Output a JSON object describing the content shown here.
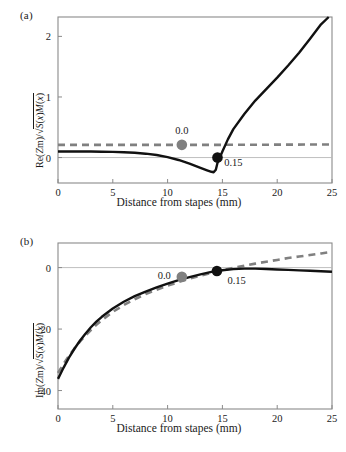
{
  "figure": {
    "panels": [
      {
        "id": "a",
        "label": "(a)",
        "xlabel": "Distance from stapes (mm)",
        "ylabel_parts": {
          "numerator": "Re(Zm)",
          "slash": "/",
          "radical": "√",
          "under_radical": "S(x)M(x)"
        },
        "annotations": [
          {
            "text": "0.0",
            "x_mm": 11.3,
            "y_val": 0.42
          },
          {
            "text": "0.15",
            "x_mm": 16.0,
            "y_val": -0.11
          }
        ],
        "markers": [
          {
            "label": "0.0",
            "color": "#808080",
            "x_mm": 11.3,
            "y_val": 0.21
          },
          {
            "label": "0.15",
            "color": "#111111",
            "x_mm": 14.55,
            "y_val": 0.0
          }
        ],
        "xticks": [
          0,
          5,
          10,
          15,
          20,
          25
        ],
        "yticks": [
          0,
          1,
          2
        ],
        "xlim": [
          0,
          25
        ],
        "ylim": [
          -0.42,
          2.32
        ]
      },
      {
        "id": "b",
        "label": "(b)",
        "xlabel": "Distance from stapes (mm)",
        "ylabel_parts": {
          "numerator": "Im(Zm)",
          "slash": "/",
          "radical": "√",
          "under_radical": "S(x)M(x)"
        },
        "annotations": [
          {
            "text": "0.0",
            "x_mm": 9.7,
            "y_val": -3.2
          },
          {
            "text": "0.15",
            "x_mm": 16.3,
            "y_val": -4.6
          }
        ],
        "markers": [
          {
            "label": "0.0",
            "color": "#808080",
            "x_mm": 11.3,
            "y_val": -3.0
          },
          {
            "label": "0.15",
            "color": "#111111",
            "x_mm": 14.5,
            "y_val": -1.1
          }
        ],
        "xticks": [
          0,
          5,
          10,
          15,
          20,
          25
        ],
        "yticks": [
          0,
          -20,
          -40
        ],
        "xlim": [
          0,
          25
        ],
        "ylim": [
          -46,
          8
        ]
      }
    ]
  },
  "chart_data": [
    {
      "type": "line",
      "panel": "a",
      "title": "",
      "xlabel": "Distance from stapes (mm)",
      "ylabel": "Re(Zm)/√(S(x)M(x))",
      "xlim": [
        0,
        25
      ],
      "ylim": [
        -0.42,
        2.32
      ],
      "xticks": [
        0,
        5,
        10,
        15,
        20,
        25
      ],
      "yticks": [
        0,
        1,
        2
      ],
      "grid": false,
      "legend": "none",
      "zero_line": true,
      "series": [
        {
          "name": "0.15",
          "style": "solid",
          "color": "#111111",
          "x": [
            0,
            1,
            2,
            3,
            4,
            5,
            6,
            7,
            8,
            9,
            10,
            11,
            12,
            13,
            13.6,
            14.0,
            14.2,
            14.4,
            14.55,
            15.0,
            15.5,
            16,
            17,
            18,
            19,
            20,
            21,
            22,
            23,
            24,
            24.7
          ],
          "y": [
            0.1,
            0.1,
            0.1,
            0.099,
            0.097,
            0.094,
            0.088,
            0.079,
            0.064,
            0.042,
            0.008,
            -0.04,
            -0.1,
            -0.17,
            -0.21,
            -0.235,
            -0.243,
            -0.2,
            -0.09,
            0.1,
            0.3,
            0.47,
            0.72,
            0.94,
            1.13,
            1.32,
            1.52,
            1.73,
            1.96,
            2.2,
            2.32
          ]
        },
        {
          "name": "0.0",
          "style": "dashed",
          "color": "#808080",
          "x": [
            0,
            5,
            10,
            15,
            20,
            25
          ],
          "y": [
            0.21,
            0.21,
            0.21,
            0.21,
            0.213,
            0.216
          ]
        }
      ]
    },
    {
      "type": "line",
      "panel": "b",
      "title": "",
      "xlabel": "Distance from stapes (mm)",
      "ylabel": "Im(Zm)/√(S(x)M(x))",
      "xlim": [
        0,
        25
      ],
      "ylim": [
        -46,
        8
      ],
      "xticks": [
        0,
        5,
        10,
        15,
        20,
        25
      ],
      "yticks": [
        0,
        -20,
        -40
      ],
      "grid": false,
      "legend": "none",
      "zero_line": true,
      "series": [
        {
          "name": "0.15",
          "style": "solid",
          "color": "#111111",
          "x": [
            0,
            0.5,
            1,
            1.5,
            2,
            2.5,
            3,
            3.5,
            4,
            5,
            6,
            7,
            8,
            9,
            10,
            11,
            12,
            13,
            14,
            14.5,
            15,
            16,
            17,
            18,
            19,
            20,
            21,
            22,
            23,
            24,
            25
          ],
          "y": [
            -36.2,
            -32.6,
            -29.3,
            -26.4,
            -23.8,
            -21.5,
            -19.4,
            -17.6,
            -16.0,
            -13.3,
            -11.1,
            -9.3,
            -7.8,
            -6.4,
            -5.2,
            -4.1,
            -3.1,
            -2.2,
            -1.4,
            -1.1,
            -0.85,
            -0.5,
            -0.35,
            -0.35,
            -0.45,
            -0.6,
            -0.75,
            -0.9,
            -1.05,
            -1.2,
            -1.35
          ]
        },
        {
          "name": "0.0",
          "style": "dashed",
          "color": "#808080",
          "x": [
            0,
            0.5,
            1,
            1.5,
            2,
            2.5,
            3,
            3.5,
            4,
            5,
            6,
            7,
            8,
            9,
            10,
            11,
            12,
            13,
            14,
            15,
            16,
            17,
            18,
            19,
            20,
            21,
            22,
            23,
            24,
            25
          ],
          "y": [
            -34.3,
            -31.4,
            -28.7,
            -26.3,
            -24.1,
            -22.1,
            -20.3,
            -18.6,
            -17.1,
            -14.4,
            -12.2,
            -10.3,
            -8.6,
            -7.2,
            -5.9,
            -4.7,
            -3.6,
            -2.6,
            -1.7,
            -0.85,
            -0.1,
            0.6,
            1.3,
            1.9,
            2.5,
            3.1,
            3.6,
            4.1,
            4.6,
            5.1
          ]
        }
      ]
    }
  ]
}
